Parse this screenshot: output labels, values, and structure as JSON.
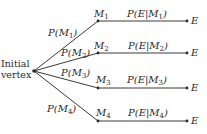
{
  "diagram": {
    "type": "probability-tree",
    "root": {
      "label_line1": "Initial",
      "label_line2": "vertex",
      "x": 34,
      "y": 71
    },
    "branches": [
      {
        "node": "M",
        "node_sub": "1",
        "node_y": 21,
        "edge_prob": "P(M",
        "edge_sub": "1",
        "edge_close": ")",
        "edge_lx": 48,
        "edge_ly": 27,
        "cond_prob": "P(E|M",
        "cond_sub": "1",
        "cond_close": ")",
        "outcome": "E"
      },
      {
        "node": "M",
        "node_sub": "2",
        "node_y": 53,
        "edge_prob": "P(M",
        "edge_sub": "2",
        "edge_close": ")",
        "edge_lx": 60,
        "edge_ly": 47,
        "cond_prob": "P(E|M",
        "cond_sub": "2",
        "cond_close": ")",
        "outcome": "E"
      },
      {
        "node": "M",
        "node_sub": "3",
        "node_y": 88,
        "edge_prob": "P(M",
        "edge_sub": "3",
        "edge_close": ")",
        "edge_lx": 60,
        "edge_ly": 67,
        "cond_prob": "P(E|M",
        "cond_sub": "3",
        "cond_close": ")",
        "outcome": "E"
      },
      {
        "node": "M",
        "node_sub": "4",
        "node_y": 121,
        "edge_prob": "P(M",
        "edge_sub": "4",
        "edge_close": ")",
        "edge_lx": 47,
        "edge_ly": 103,
        "cond_prob": "P(E|M",
        "cond_sub": "4",
        "cond_close": ")",
        "outcome": "E"
      }
    ],
    "node_x": 98,
    "end_x": 187,
    "line_color": "#3a3a3a"
  }
}
